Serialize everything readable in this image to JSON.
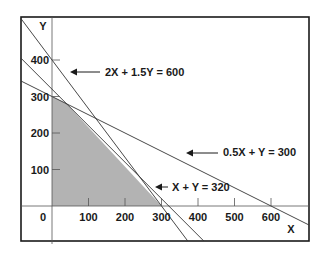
{
  "axes": {
    "x_label": "X",
    "y_label": "Y",
    "origin_label": "0",
    "x_ticks": [
      100,
      200,
      300,
      400,
      500,
      600
    ],
    "y_ticks": [
      100,
      200,
      300,
      400
    ],
    "x_range": [
      0,
      700
    ],
    "y_range": [
      0,
      450
    ]
  },
  "constraints": [
    {
      "label": "2X + 1.5Y = 600",
      "a": 2,
      "b": 1.5,
      "c": 600
    },
    {
      "label": "0.5X + Y = 300",
      "a": 0.5,
      "b": 1,
      "c": 300
    },
    {
      "label": "X + Y = 320",
      "a": 1,
      "b": 1,
      "c": 320
    }
  ],
  "feasible_region": {
    "vertices": [
      [
        0,
        0
      ],
      [
        0,
        300
      ],
      [
        40,
        280
      ],
      [
        300,
        0
      ]
    ],
    "fill_color": "#b3b3b3"
  },
  "colors": {
    "line": "#333333",
    "frame": "#1a1a1a"
  }
}
